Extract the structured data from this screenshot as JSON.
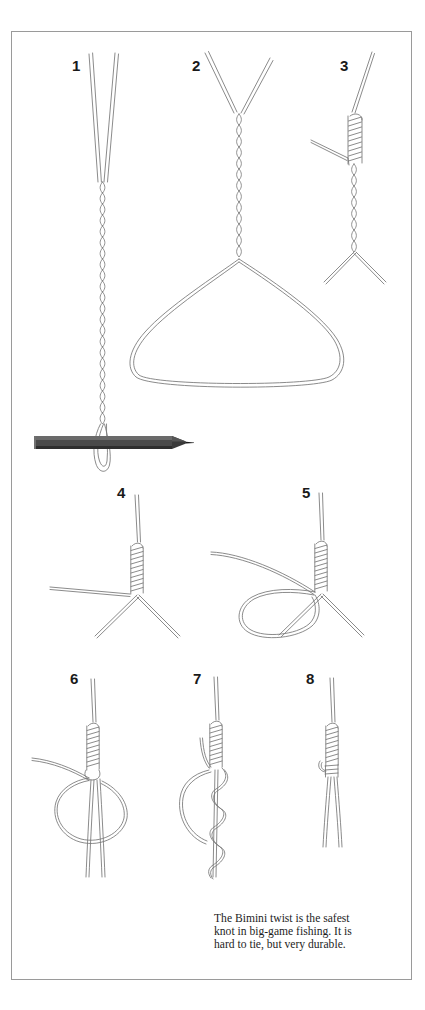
{
  "figure": {
    "frame_color": "#9a9a9a",
    "line_color": "#6f6f6f",
    "background": "#ffffff"
  },
  "steps": [
    {
      "number": "1",
      "label_x": 60,
      "label_y": 26
    },
    {
      "number": "2",
      "label_x": 180,
      "label_y": 26
    },
    {
      "number": "3",
      "label_x": 328,
      "label_y": 26
    },
    {
      "number": "4",
      "label_x": 105,
      "label_y": 453
    },
    {
      "number": "5",
      "label_x": 290,
      "label_y": 453
    },
    {
      "number": "6",
      "label_x": 58,
      "label_y": 639
    },
    {
      "number": "7",
      "label_x": 181,
      "label_y": 639
    },
    {
      "number": "8",
      "label_x": 294,
      "label_y": 639
    }
  ],
  "caption": {
    "line1": "The Bimini twist is the safest",
    "line2": "knot in big-game fishing. It is",
    "line3": "hard to tie, but very durable."
  },
  "tool": {
    "name": "pencil-dowel",
    "color": "#3b3b3b"
  }
}
